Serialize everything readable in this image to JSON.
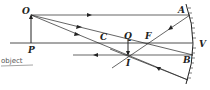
{
  "diagram": {
    "type": "concave-mirror-ray-diagram",
    "labels": {
      "object_top": "O",
      "object_base": "P",
      "center_of_curvature": "C",
      "image_top": "Q",
      "focus": "F",
      "image": "I",
      "point_a": "A",
      "point_b": "B",
      "vertex": "V",
      "handwritten_note": "object"
    },
    "colors": {
      "line": "#222222",
      "note": "#555555",
      "background": "#ffffff"
    }
  }
}
